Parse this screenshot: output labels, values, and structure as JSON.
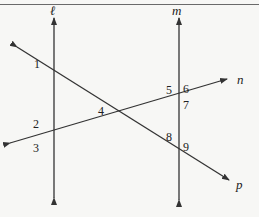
{
  "figure": {
    "lines": [
      {
        "id": "l",
        "label": "ℓ",
        "type": "vertical",
        "x": 54,
        "from": [
          54,
          198
        ],
        "to": [
          54,
          18
        ]
      },
      {
        "id": "m",
        "label": "m",
        "type": "vertical",
        "x": 179,
        "from": [
          179,
          200
        ],
        "to": [
          179,
          18
        ]
      },
      {
        "id": "n",
        "label": "n",
        "type": "transversal",
        "from": [
          10,
          143
        ],
        "to": [
          227,
          79
        ]
      },
      {
        "id": "p",
        "label": "p",
        "type": "transversal",
        "from": [
          17,
          47
        ],
        "to": [
          229,
          180
        ]
      }
    ],
    "line_labels": {
      "l": "ℓ",
      "m": "m",
      "n": "n",
      "p": "p"
    },
    "angles": [
      {
        "label": "1",
        "at": "l∩p",
        "x": 34,
        "y": 68
      },
      {
        "label": "2",
        "at": "l∩n",
        "x": 33,
        "y": 128
      },
      {
        "label": "3",
        "at": "l∩n",
        "x": 33,
        "y": 152
      },
      {
        "label": "4",
        "at": "n∩p",
        "x": 102,
        "y": 117
      },
      {
        "label": "5",
        "at": "m∩n",
        "x": 168,
        "y": 93
      },
      {
        "label": "6",
        "at": "m∩n",
        "x": 183,
        "y": 93
      },
      {
        "label": "7",
        "at": "m∩n",
        "x": 184,
        "y": 109
      },
      {
        "label": "8",
        "at": "m∩p",
        "x": 168,
        "y": 143
      },
      {
        "label": "9",
        "at": "m∩p",
        "x": 184,
        "y": 151
      }
    ],
    "intersections": {
      "l_p": [
        54,
        73
      ],
      "l_n": [
        54,
        132
      ],
      "n_p": [
        123,
        113
      ],
      "m_n": [
        179,
        98
      ],
      "m_p": [
        179,
        147
      ]
    }
  },
  "colors": {
    "line": "#333333",
    "background": "#f7f7f5",
    "frame": "#6a6a6a"
  }
}
